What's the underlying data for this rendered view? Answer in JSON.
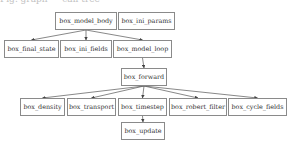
{
  "caption": "Fig. graph — call tree",
  "nodes": {
    "model_body": {
      "label": "box_model_body",
      "x": 55,
      "y": 12,
      "w": 62,
      "h": 18
    },
    "ini_params": {
      "label": "box_ini_params",
      "x": 118,
      "y": 12,
      "w": 57,
      "h": 18
    },
    "final_state": {
      "label": "box_final_state",
      "x": 4,
      "y": 40,
      "w": 55,
      "h": 18
    },
    "ini_fields": {
      "label": "box_ini_fields",
      "x": 60,
      "y": 40,
      "w": 52,
      "h": 18
    },
    "model_loop": {
      "label": "box_model_loop",
      "x": 113,
      "y": 40,
      "w": 59,
      "h": 18
    },
    "forward": {
      "label": "box_forward",
      "x": 121,
      "y": 68,
      "w": 46,
      "h": 18
    },
    "density": {
      "label": "box_density",
      "x": 20,
      "y": 98,
      "w": 45,
      "h": 18
    },
    "transport": {
      "label": "box_transport",
      "x": 67,
      "y": 98,
      "w": 49,
      "h": 18
    },
    "timestep": {
      "label": "box_timestep",
      "x": 118,
      "y": 98,
      "w": 49,
      "h": 18
    },
    "robert_filter": {
      "label": "box_robert_filter",
      "x": 169,
      "y": 98,
      "w": 58,
      "h": 18
    },
    "cycle_fields": {
      "label": "box_cycle_fields",
      "x": 228,
      "y": 98,
      "w": 59,
      "h": 18
    },
    "update": {
      "label": "box_update",
      "x": 121,
      "y": 122,
      "w": 44,
      "h": 18
    }
  },
  "edges": [
    {
      "from": "model_body",
      "to": "final_state"
    },
    {
      "from": "model_body",
      "to": "ini_fields"
    },
    {
      "from": "model_body",
      "to": "model_loop"
    },
    {
      "from": "model_loop",
      "to": "forward"
    },
    {
      "from": "forward",
      "to": "density"
    },
    {
      "from": "forward",
      "to": "transport"
    },
    {
      "from": "forward",
      "to": "timestep"
    },
    {
      "from": "forward",
      "to": "robert_filter"
    },
    {
      "from": "forward",
      "to": "cycle_fields"
    },
    {
      "from": "timestep",
      "to": "update"
    }
  ],
  "colors": {
    "edge": "#555555",
    "border": "#8a8a8a",
    "text": "#333333"
  }
}
